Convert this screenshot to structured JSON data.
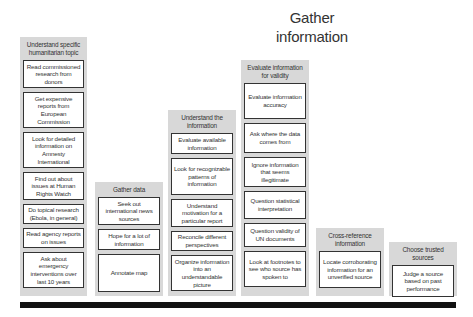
{
  "title": "Gather information",
  "columns": [
    {
      "heading": "Understand specific humanitarian topic",
      "items": [
        "Read commissioned research from donors",
        "Get expensive reports from European Commission",
        "Look for detailed information on Amnesty International",
        "Find out about issues at Human Rights Watch",
        "Do topical research (Ebola, in general)",
        "Read agency reports on issues",
        "Ask about emergency interventions over last 10 years"
      ]
    },
    {
      "heading": "Gather data",
      "items": [
        "Seek out international news sources",
        "Hope for a lot of information",
        "Annotate map"
      ]
    },
    {
      "heading": "Understand the information",
      "items": [
        "Evaluate available information",
        "Look for recognizable patterns of information",
        "Understand motivation for a particular report",
        "Reconcile different perspectives",
        "Organize information into an understandable picture"
      ]
    },
    {
      "heading": "Evaluate information for validity",
      "items": [
        "Evaluate information accuracy",
        "Ask where the data comes from",
        "Ignore information that seems illegitimate",
        "Question statistical interpretation",
        "Question validity of UN documents",
        "Look at footnotes to see who source has spoken to"
      ]
    },
    {
      "heading": "Cross-reference information",
      "items": [
        "Locate corroborating information for an unverified source"
      ]
    },
    {
      "heading": "Choose trusted sources",
      "items": [
        "Judge a source based on past performance"
      ]
    }
  ],
  "colors": {
    "column_bg": "#d8d8d8",
    "box_border": "#333333",
    "baseline_bar": "#111111"
  }
}
